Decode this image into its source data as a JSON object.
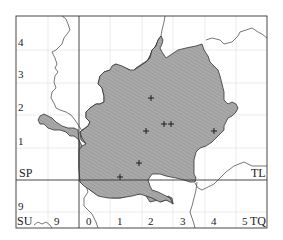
{
  "map": {
    "frame": {
      "x": 16,
      "y": 16,
      "w": 251,
      "h": 212
    },
    "colors": {
      "county_fill": "#a9a9a9",
      "hatch": "#8f8f8f",
      "outline": "#333333",
      "frame": "#333333",
      "grid_minor": "#dcdcdc",
      "boundary": "#555555"
    },
    "square_labels": {
      "sp": "SP",
      "tl": "TL",
      "su": "SU",
      "tq": "TQ"
    },
    "y_tick_labels": [
      {
        "text": "4",
        "y": 46
      },
      {
        "text": "3",
        "y": 78
      },
      {
        "text": "2",
        "y": 111
      },
      {
        "text": "1",
        "y": 145
      },
      {
        "text": "9",
        "y": 210
      }
    ],
    "x_tick_labels": [
      {
        "text": "9",
        "x": 54
      },
      {
        "text": "0",
        "x": 86
      },
      {
        "text": "1",
        "x": 117
      },
      {
        "text": "2",
        "x": 148
      },
      {
        "text": "3",
        "x": 180
      },
      {
        "text": "4",
        "x": 211
      },
      {
        "text": "5",
        "x": 242
      }
    ],
    "record_markers": [
      {
        "x": 151,
        "y": 98
      },
      {
        "x": 164,
        "y": 124
      },
      {
        "x": 171,
        "y": 124
      },
      {
        "x": 146,
        "y": 131
      },
      {
        "x": 214,
        "y": 131
      },
      {
        "x": 139,
        "y": 163
      },
      {
        "x": 120,
        "y": 177
      }
    ]
  }
}
